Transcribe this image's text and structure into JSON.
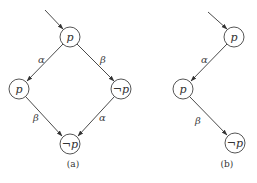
{
  "diagrams": [
    {
      "id": "a",
      "caption": "(a)",
      "nodes": [
        {
          "id": "a_top",
          "label": "p",
          "x": 70,
          "y": 37
        },
        {
          "id": "a_left",
          "label": "p",
          "x": 19,
          "y": 89
        },
        {
          "id": "a_right",
          "label": "¬p",
          "x": 121,
          "y": 89
        },
        {
          "id": "a_bottom",
          "label": "¬p",
          "x": 70,
          "y": 144
        }
      ],
      "entry": {
        "from": [
          45,
          10
        ],
        "to": "a_top"
      },
      "edges": [
        {
          "from": "a_top",
          "to": "a_left",
          "label": "α"
        },
        {
          "from": "a_top",
          "to": "a_right",
          "label": "β"
        },
        {
          "from": "a_left",
          "to": "a_bottom",
          "label": "β"
        },
        {
          "from": "a_right",
          "to": "a_bottom",
          "label": "α"
        }
      ]
    },
    {
      "id": "b",
      "caption": "(b)",
      "nodes": [
        {
          "id": "b_top",
          "label": "p",
          "x": 234,
          "y": 37
        },
        {
          "id": "b_mid",
          "label": "p",
          "x": 183,
          "y": 89
        },
        {
          "id": "b_bottom",
          "label": "¬p",
          "x": 235,
          "y": 143
        }
      ],
      "entry": {
        "from": [
          208,
          12
        ],
        "to": "b_top"
      },
      "edges": [
        {
          "from": "b_top",
          "to": "b_mid",
          "label": "α"
        },
        {
          "from": "b_mid",
          "to": "b_bottom",
          "label": "β"
        }
      ]
    }
  ],
  "labels": {
    "a_top": "p",
    "a_left": "p",
    "a_right": "¬p",
    "a_bottom": "¬p",
    "a_edge_top_left": "α",
    "a_edge_top_right": "β",
    "a_edge_left_bottom": "β",
    "a_edge_right_bottom": "α",
    "a_caption": "(a)",
    "b_top": "p",
    "b_mid": "p",
    "b_bottom": "¬p",
    "b_edge_top_mid": "α",
    "b_edge_mid_bottom": "β",
    "b_caption": "(b)"
  },
  "colors": {
    "stroke": "#4a4a4a",
    "text": "#333333",
    "background": "#ffffff"
  }
}
